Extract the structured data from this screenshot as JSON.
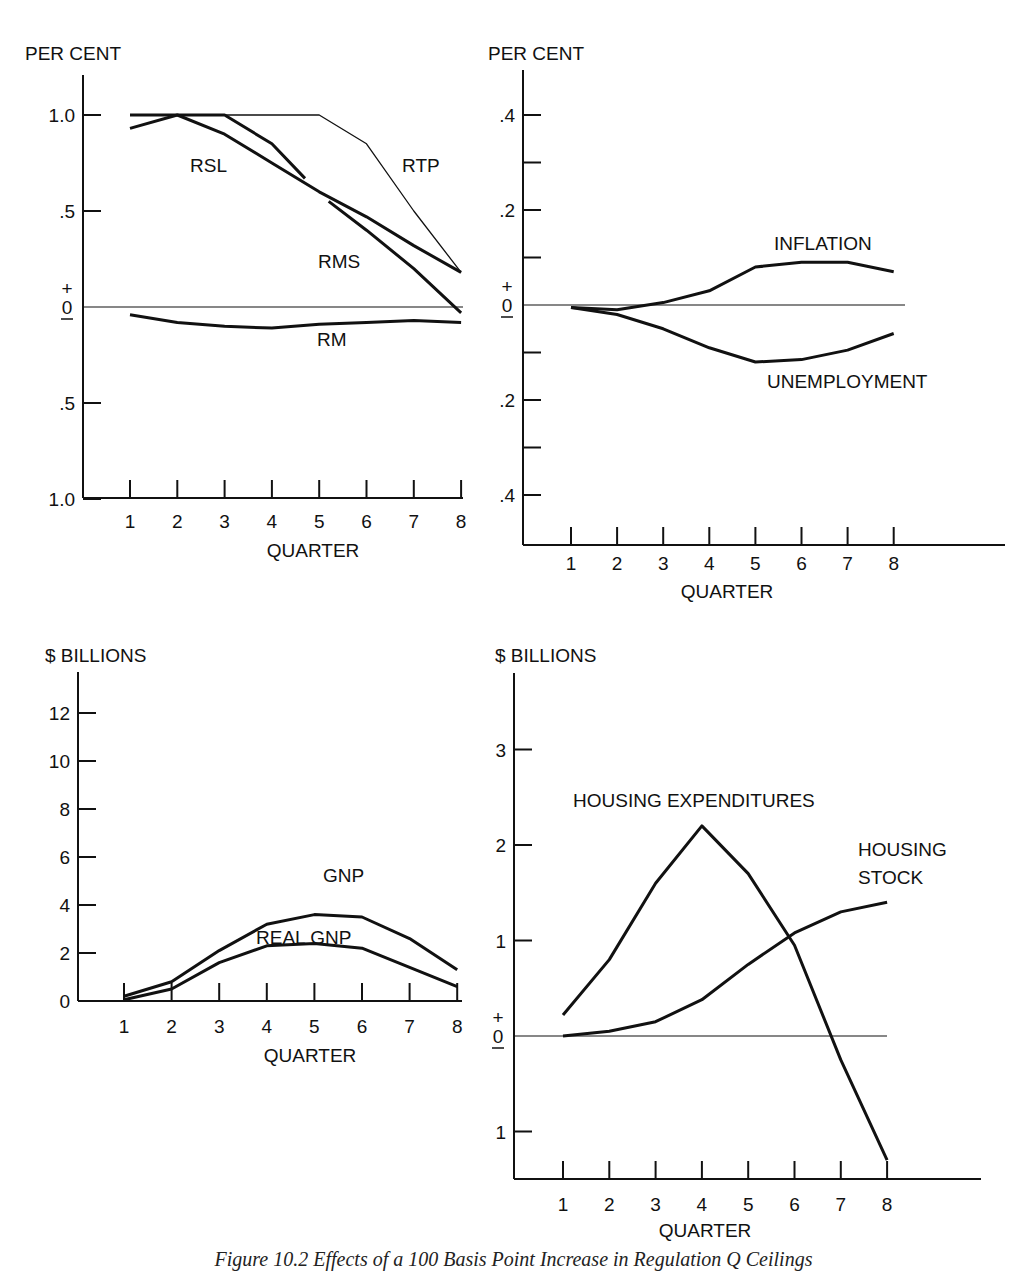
{
  "caption": "Figure 10.2  Effects of a 100 Basis Point Increase in Regulation Q Ceilings",
  "chart_data": [
    {
      "id": "top-left",
      "type": "line",
      "ylabel": "PER CENT",
      "xlabel": "QUARTER",
      "x": [
        1,
        2,
        3,
        4,
        5,
        6,
        7,
        8
      ],
      "y_ticks": [
        "1.0",
        ".5",
        "0",
        ".5",
        "1.0"
      ],
      "ylim": [
        -1.0,
        1.0
      ],
      "sign_marks": {
        "plus": "+",
        "minus": "–"
      },
      "series": [
        {
          "name": "RTP",
          "values": [
            1.0,
            1.0,
            1.0,
            1.0,
            1.0,
            0.85,
            0.5,
            0.18
          ],
          "style": "thin"
        },
        {
          "name": "RSL",
          "values": [
            1.0,
            1.0,
            1.0,
            0.85,
            0.67,
            null,
            null,
            null
          ],
          "style": "thick",
          "note": "ends near quarter 4.7"
        },
        {
          "name": "RMS-upper",
          "values": [
            0.93,
            1.0,
            0.9,
            0.75,
            0.6,
            0.47,
            0.32,
            0.18
          ],
          "style": "thick"
        },
        {
          "name": "RMS",
          "values": [
            null,
            null,
            null,
            null,
            0.55,
            0.37,
            0.17,
            -0.03
          ],
          "style": "thick",
          "note": "starts near quarter 5.2"
        },
        {
          "name": "RM",
          "values": [
            -0.04,
            -0.08,
            -0.1,
            -0.11,
            -0.09,
            -0.08,
            -0.07,
            -0.08
          ],
          "style": "thick"
        }
      ],
      "labels": [
        "RSL",
        "RTP",
        "RMS",
        "RM"
      ]
    },
    {
      "id": "top-right",
      "type": "line",
      "ylabel": "PER CENT",
      "xlabel": "QUARTER",
      "x": [
        1,
        2,
        3,
        4,
        5,
        6,
        7,
        8
      ],
      "y_ticks": [
        ".4",
        ".2",
        "0",
        ".2",
        ".4"
      ],
      "ylim": [
        -0.5,
        0.4
      ],
      "sign_marks": {
        "plus": "+",
        "minus": "–"
      },
      "series": [
        {
          "name": "INFLATION",
          "values": [
            -0.005,
            -0.01,
            0.005,
            0.03,
            0.08,
            0.09,
            0.09,
            0.07
          ]
        },
        {
          "name": "UNEMPLOYMENT",
          "values": [
            -0.005,
            -0.02,
            -0.05,
            -0.09,
            -0.12,
            -0.115,
            -0.095,
            -0.06
          ]
        }
      ]
    },
    {
      "id": "bottom-left",
      "type": "line",
      "ylabel": "$ BILLIONS",
      "xlabel": "QUARTER",
      "x": [
        1,
        2,
        3,
        4,
        5,
        6,
        7,
        8
      ],
      "y_ticks": [
        "12",
        "10",
        "8",
        "6",
        "4",
        "2",
        "0"
      ],
      "ylim": [
        0,
        14
      ],
      "series": [
        {
          "name": "GNP",
          "values": [
            0.2,
            0.8,
            2.1,
            3.2,
            3.6,
            3.5,
            2.6,
            1.3
          ]
        },
        {
          "name": "REAL GNP",
          "values": [
            0.05,
            0.5,
            1.6,
            2.3,
            2.4,
            2.2,
            1.4,
            0.6
          ]
        }
      ]
    },
    {
      "id": "bottom-right",
      "type": "line",
      "ylabel": "$ BILLIONS",
      "xlabel": "QUARTER",
      "x": [
        1,
        2,
        3,
        4,
        5,
        6,
        7,
        8
      ],
      "y_ticks": [
        "3",
        "2",
        "1",
        "0",
        "1"
      ],
      "ylim": [
        -1.5,
        3.5
      ],
      "sign_marks": {
        "plus": "+",
        "minus": "–"
      },
      "series": [
        {
          "name": "HOUSING EXPENDITURES",
          "values": [
            0.22,
            0.8,
            1.6,
            2.2,
            1.7,
            0.95,
            -0.25,
            -1.3
          ]
        },
        {
          "name": "HOUSING STOCK",
          "values": [
            0.0,
            0.05,
            0.15,
            0.38,
            0.75,
            1.08,
            1.3,
            1.4
          ]
        }
      ],
      "labels": [
        "HOUSING EXPENDITURES",
        "HOUSING",
        "STOCK"
      ]
    }
  ]
}
